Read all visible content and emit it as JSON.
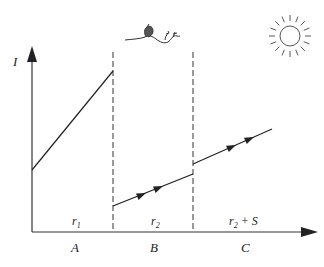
{
  "diagram": {
    "y_axis_label": "I",
    "regions": [
      {
        "letter": "A",
        "resistance": "r",
        "sub": "1",
        "suffix": ""
      },
      {
        "letter": "B",
        "resistance": "r",
        "sub": "2",
        "suffix": ""
      },
      {
        "letter": "C",
        "resistance": "r",
        "sub": "2",
        "suffix": " + S"
      }
    ],
    "icons": {
      "top_center": "bird-on-branch-sketch",
      "top_right": "sun-icon"
    },
    "colors": {
      "ink": "#222222",
      "background": "#ffffff"
    }
  }
}
